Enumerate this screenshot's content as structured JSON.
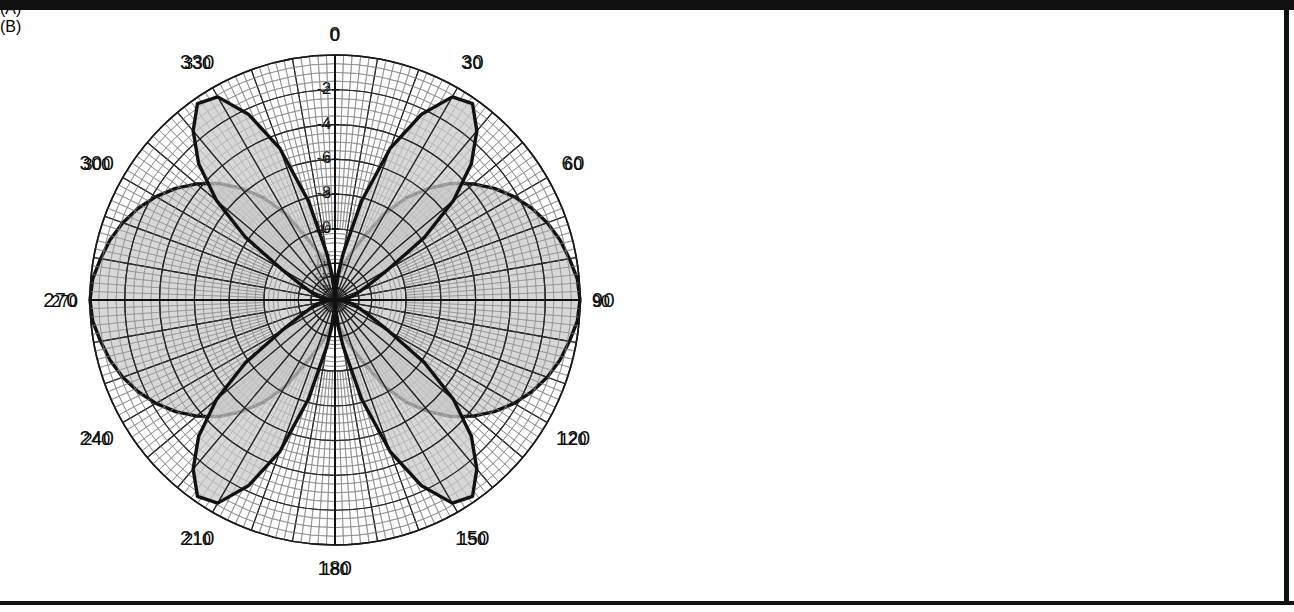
{
  "figure": {
    "caption_a": "(A)",
    "caption_b": "(B)"
  },
  "chart_data": [
    {
      "id": "plot-a",
      "type": "polar",
      "title": "",
      "panel_label": "(A)",
      "description": "Polar antenna radiation pattern with two broad lobes along the 0-180 degree axis (figure-eight / dipole-like pattern)",
      "angle_unit": "degrees",
      "angle_labels": [
        "0",
        "30",
        "60",
        "90",
        "120",
        "150",
        "180",
        "210",
        "240",
        "270",
        "300",
        "330"
      ],
      "angle_label_values": [
        0,
        30,
        60,
        90,
        120,
        150,
        180,
        210,
        240,
        270,
        300,
        330
      ],
      "angle_tick_step_major": 10,
      "angle_tick_step_minor": 2,
      "radial_unit": "dB",
      "radial_labels": [
        "-2",
        "-4",
        "-6",
        "-8",
        "-10",
        "-15",
        "-20",
        "-30"
      ],
      "radial_label_values": [
        -2,
        -4,
        -6,
        -8,
        -10,
        -15,
        -20,
        -30
      ],
      "radial_outer_value": 0,
      "radial_min_value": -40,
      "grid": true,
      "fill": "#c8c8c8",
      "stroke": "#111111",
      "pattern": {
        "formula": "relative field magnitude vs angle, normalized 0 dB peak at 90 and 270 degrees",
        "lobe_count": 2,
        "peak_angles_deg": [
          90,
          270
        ],
        "null_angles_deg": [
          0,
          180
        ],
        "samples_deg_db": [
          [
            0,
            -40
          ],
          [
            5,
            -24
          ],
          [
            10,
            -18
          ],
          [
            15,
            -14.5
          ],
          [
            20,
            -12
          ],
          [
            25,
            -10
          ],
          [
            30,
            -8.3
          ],
          [
            35,
            -6.9
          ],
          [
            40,
            -5.7
          ],
          [
            45,
            -4.6
          ],
          [
            50,
            -3.7
          ],
          [
            55,
            -2.9
          ],
          [
            60,
            -2.2
          ],
          [
            65,
            -1.6
          ],
          [
            70,
            -1.1
          ],
          [
            75,
            -0.7
          ],
          [
            80,
            -0.4
          ],
          [
            85,
            -0.1
          ],
          [
            90,
            0
          ],
          [
            95,
            -0.1
          ],
          [
            100,
            -0.4
          ],
          [
            105,
            -0.7
          ],
          [
            110,
            -1.1
          ],
          [
            115,
            -1.6
          ],
          [
            120,
            -2.2
          ],
          [
            125,
            -2.9
          ],
          [
            130,
            -3.7
          ],
          [
            135,
            -4.6
          ],
          [
            140,
            -5.7
          ],
          [
            145,
            -6.9
          ],
          [
            150,
            -8.3
          ],
          [
            155,
            -10
          ],
          [
            160,
            -12
          ],
          [
            165,
            -14.5
          ],
          [
            170,
            -18
          ],
          [
            175,
            -24
          ],
          [
            180,
            -40
          ]
        ]
      }
    },
    {
      "id": "plot-b",
      "type": "polar",
      "title": "",
      "panel_label": "(B)",
      "description": "Polar antenna radiation pattern with four lobes centered near 30, 150, 210 and 330 degrees (four-leaf clover pattern)",
      "angle_unit": "degrees",
      "angle_labels": [
        "0",
        "30",
        "60",
        "90",
        "120",
        "150",
        "180",
        "210",
        "240",
        "270",
        "300",
        "330"
      ],
      "angle_label_values": [
        0,
        30,
        60,
        90,
        120,
        150,
        180,
        210,
        240,
        270,
        300,
        330
      ],
      "angle_tick_step_major": 10,
      "angle_tick_step_minor": 2,
      "radial_unit": "dB",
      "radial_labels": [
        "-2",
        "-4",
        "-6",
        "-8",
        "-10",
        "-15",
        "-20",
        "-30"
      ],
      "radial_label_values": [
        -2,
        -4,
        -6,
        -8,
        -10,
        -15,
        -20,
        -30
      ],
      "radial_outer_value": 0,
      "radial_min_value": -40,
      "grid": true,
      "fill": "#c8c8c8",
      "stroke": "#111111",
      "pattern": {
        "formula": "four-lobe pattern, peaks at 30, 150, 210, 330 degrees; nulls at 0, 90, 180, 270 degrees",
        "lobe_count": 4,
        "peak_angles_deg": [
          30,
          150,
          210,
          330
        ],
        "null_angles_deg": [
          0,
          90,
          180,
          270
        ],
        "samples_deg_db": [
          [
            0,
            -40
          ],
          [
            5,
            -22
          ],
          [
            10,
            -13
          ],
          [
            15,
            -8.2
          ],
          [
            20,
            -4.8
          ],
          [
            25,
            -2.3
          ],
          [
            30,
            -0.6
          ],
          [
            35,
            -0.3
          ],
          [
            40,
            -1.4
          ],
          [
            45,
            -3.0
          ],
          [
            50,
            -5.2
          ],
          [
            55,
            -7.8
          ],
          [
            60,
            -11
          ],
          [
            65,
            -14.5
          ],
          [
            70,
            -18.5
          ],
          [
            75,
            -23
          ],
          [
            80,
            -28
          ],
          [
            85,
            -34
          ],
          [
            90,
            -40
          ],
          [
            95,
            -34
          ],
          [
            100,
            -28
          ],
          [
            105,
            -23
          ],
          [
            110,
            -18.5
          ],
          [
            115,
            -14.5
          ],
          [
            120,
            -11
          ],
          [
            125,
            -7.8
          ],
          [
            130,
            -5.2
          ],
          [
            135,
            -3.0
          ],
          [
            140,
            -1.4
          ],
          [
            145,
            -0.3
          ],
          [
            150,
            -0.6
          ],
          [
            155,
            -2.3
          ],
          [
            160,
            -4.8
          ],
          [
            165,
            -8.2
          ],
          [
            170,
            -13
          ],
          [
            175,
            -22
          ],
          [
            180,
            -40
          ]
        ]
      }
    }
  ]
}
